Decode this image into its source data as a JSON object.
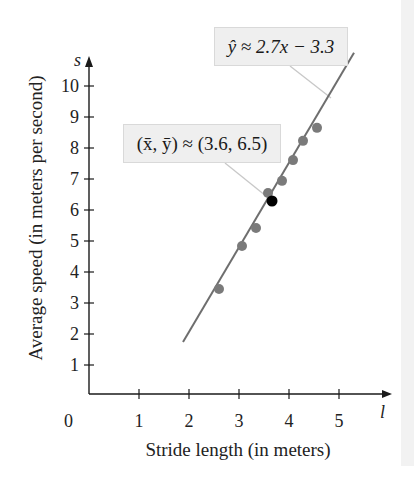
{
  "chart_data": {
    "type": "scatter",
    "title": "",
    "xlabel": "Stride length (in meters)",
    "ylabel": "Average speed (in meters per second)",
    "x_axis_var": "l",
    "y_axis_var": "s",
    "xlim": [
      0,
      5.8
    ],
    "ylim": [
      0,
      10.8
    ],
    "x_ticks": [
      1,
      2,
      3,
      4,
      5
    ],
    "y_ticks": [
      1,
      2,
      3,
      4,
      5,
      6,
      7,
      8,
      9,
      10
    ],
    "origin_label": "0",
    "grid": false,
    "legend": null,
    "series": [
      {
        "name": "observations",
        "type": "scatter",
        "color": "#7a7a7a",
        "points": [
          {
            "x": 2.6,
            "y": 3.45
          },
          {
            "x": 3.06,
            "y": 4.84
          },
          {
            "x": 3.34,
            "y": 5.42
          },
          {
            "x": 3.58,
            "y": 6.55
          },
          {
            "x": 3.86,
            "y": 6.94
          },
          {
            "x": 4.08,
            "y": 7.61
          },
          {
            "x": 4.28,
            "y": 8.23
          },
          {
            "x": 4.56,
            "y": 8.65
          }
        ]
      },
      {
        "name": "mean point",
        "type": "scatter",
        "color": "#000000",
        "points": [
          {
            "x": 3.66,
            "y": 6.29
          }
        ]
      },
      {
        "name": "regression line",
        "type": "line",
        "color": "#6e6e6e",
        "slope": 2.7,
        "intercept": -3.3,
        "x_range": [
          1.88,
          5.3
        ]
      }
    ],
    "annotations": [
      {
        "text": "ŷ ≈ 2.7x − 3.3",
        "target": "regression line"
      },
      {
        "text": "(x̄, ȳ) ≈ (3.6, 6.5)",
        "target": "mean point"
      }
    ]
  },
  "labels": {
    "x_axis_title": "Stride length (in meters)",
    "y_axis_title": "Average speed (in meters per second)",
    "x_var": "l",
    "y_var": "s",
    "origin": "0",
    "x_ticks": [
      "1",
      "2",
      "3",
      "4",
      "5"
    ],
    "y_ticks": [
      "1",
      "2",
      "3",
      "4",
      "5",
      "6",
      "7",
      "8",
      "9",
      "10"
    ],
    "callout_regression": "ŷ ≈ 2.7x − 3.3",
    "callout_mean": "(x̄, ȳ) ≈ (3.6, 6.5)"
  },
  "colors": {
    "axis": "#1a1a1a",
    "points": "#7a7a7a",
    "mean_point": "#000000",
    "line": "#6e6e6e",
    "leader": "#c8c8c8",
    "callout_bg": "#efefef"
  }
}
